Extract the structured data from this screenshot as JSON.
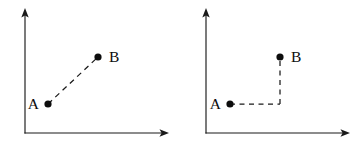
{
  "figure": {
    "background_color": "#ffffff",
    "ink_color": "#1a1a1a",
    "width": 362,
    "height": 148,
    "panel_count": 2
  },
  "panels": [
    {
      "id": "left",
      "name": "direct-path-panel",
      "description": "Direct diagonal dashed displacement from A to B",
      "axes": {
        "origin": {
          "x": 25,
          "y": 133
        },
        "y_axis_top": {
          "x": 25,
          "y": 12
        },
        "x_axis_right": {
          "x": 168,
          "y": 133
        },
        "arrowheads": [
          "y-axis-up",
          "x-axis-right"
        ]
      },
      "points": [
        {
          "label": "A",
          "x": 48,
          "y": 104,
          "label_x": 36,
          "label_y": 109,
          "label_side": "left"
        },
        {
          "label": "B",
          "x": 98,
          "y": 57,
          "label_x": 110,
          "label_y": 62,
          "label_side": "right"
        }
      ],
      "path": {
        "style": "dashed",
        "kind": "diagonal",
        "segments": [
          {
            "from": "A",
            "to": "B",
            "x1": 48,
            "y1": 104,
            "x2": 98,
            "y2": 57
          }
        ]
      }
    },
    {
      "id": "right",
      "name": "component-path-panel",
      "description": "L-shaped dashed path: horizontal component from A then vertical component up to B",
      "axes": {
        "origin": {
          "x": 25,
          "y": 133
        },
        "y_axis_top": {
          "x": 25,
          "y": 12
        },
        "x_axis_right": {
          "x": 168,
          "y": 133
        },
        "arrowheads": [
          "y-axis-up",
          "x-axis-right"
        ]
      },
      "points": [
        {
          "label": "A",
          "x": 49,
          "y": 104,
          "label_x": 37,
          "label_y": 109,
          "label_side": "left"
        },
        {
          "label": "B",
          "x": 99,
          "y": 57,
          "label_x": 111,
          "label_y": 62,
          "label_side": "right"
        }
      ],
      "path": {
        "style": "dashed",
        "kind": "orthogonal",
        "corner": {
          "x": 99,
          "y": 104
        },
        "segments": [
          {
            "from": "A",
            "to": "corner",
            "x1": 49,
            "y1": 104,
            "x2": 99,
            "y2": 104
          },
          {
            "from": "corner",
            "to": "B",
            "x1": 99,
            "y1": 104,
            "x2": 99,
            "y2": 57
          }
        ]
      }
    }
  ],
  "labels": {
    "point_a": "A",
    "point_b": "B"
  }
}
